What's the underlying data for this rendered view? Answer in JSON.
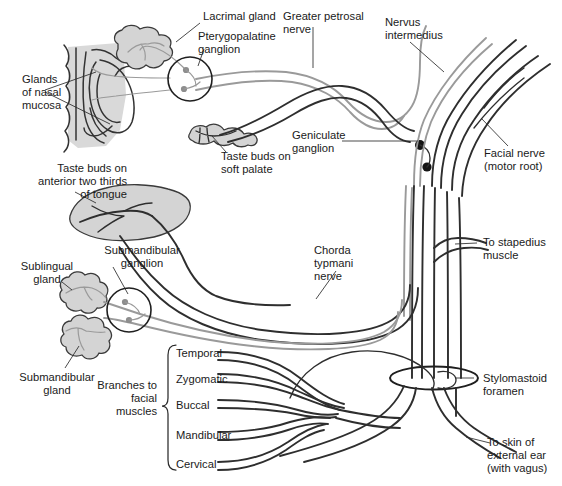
{
  "figure": {
    "background_color": "#ffffff",
    "colors": {
      "parasympathetic_gray": "#9a9a9a",
      "nerve_dark": "#2e2e2e",
      "organ_fill": "#d4d4d4",
      "text": "#1a1a1a"
    }
  },
  "labels": {
    "lacrimal_gland": "Lacrimal gland",
    "pterygopalatine_ganglion_l1": "Pterygopalatine",
    "pterygopalatine_ganglion_l2": "ganglion",
    "greater_petrosal_l1": "Greater petrosal",
    "greater_petrosal_l2": "nerve",
    "nervus_intermedius_l1": "Nervus",
    "nervus_intermedius_l2": "intermedius",
    "glands_nasal_l1": "Glands",
    "glands_nasal_l2": "of nasal",
    "glands_nasal_l3": "mucosa",
    "taste_soft_palate_l1": "Taste buds on",
    "taste_soft_palate_l2": "soft palate",
    "geniculate_ganglion_l1": "Geniculate",
    "geniculate_ganglion_l2": "ganglion",
    "facial_nerve_l1": "Facial nerve",
    "facial_nerve_l2": "(motor root)",
    "taste_tongue_l1": "Taste buds on",
    "taste_tongue_l2": "anterior two thirds",
    "taste_tongue_l3": "of tongue",
    "submandibular_ganglion_l1": "Submandibular",
    "submandibular_ganglion_l2": "ganglion",
    "sublingual_gland_l1": "Sublingual",
    "sublingual_gland_l2": "gland",
    "submandibular_gland_l1": "Submandibular",
    "submandibular_gland_l2": "gland",
    "chorda_tympani_l1": "Chorda",
    "chorda_tympani_l2": "typmani",
    "chorda_tympani_l3": "nerve",
    "to_stapedius_l1": "To stapedius",
    "to_stapedius_l2": "muscle",
    "stylomastoid_l1": "Stylomastoid",
    "stylomastoid_l2": "foramen",
    "to_skin_ear_l1": "To skin of",
    "to_skin_ear_l2": "external ear",
    "to_skin_ear_l3": "(with vagus)",
    "branches_facial_l1": "Branches to",
    "branches_facial_l2": "facial",
    "branches_facial_l3": "muscles"
  },
  "branches": [
    {
      "name": "Temporal"
    },
    {
      "name": "Zygomatic"
    },
    {
      "name": "Buccal"
    },
    {
      "name": "Mandibular"
    },
    {
      "name": "Cervical"
    }
  ],
  "structures": [
    {
      "name": "lacrimal-gland",
      "kind": "gland"
    },
    {
      "name": "nasal-mucosa",
      "kind": "section"
    },
    {
      "name": "soft-palate",
      "kind": "section"
    },
    {
      "name": "tongue",
      "kind": "organ"
    },
    {
      "name": "sublingual-gland",
      "kind": "gland"
    },
    {
      "name": "submandibular-gland",
      "kind": "gland"
    },
    {
      "name": "pterygopalatine-ganglion",
      "kind": "ganglion"
    },
    {
      "name": "submandibular-ganglion",
      "kind": "ganglion"
    },
    {
      "name": "geniculate-ganglion",
      "kind": "ganglion"
    },
    {
      "name": "stylomastoid-foramen",
      "kind": "foramen"
    }
  ]
}
